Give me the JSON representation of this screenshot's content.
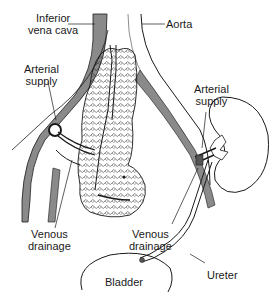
{
  "labels": {
    "ivc": [
      "Inferior",
      "vena cava"
    ],
    "aorta": "Aorta",
    "arterial_left": [
      "Arterial",
      "supply"
    ],
    "arterial_right": [
      "Arterial",
      "supply"
    ],
    "venous_left": [
      "Venous",
      "drainage"
    ],
    "venous_right": [
      "Venous",
      "drainage"
    ],
    "ureter": "Ureter",
    "bladder": "Bladder"
  },
  "colors": {
    "ink": "#1a1a1a",
    "vessel_fill": "#8a8a8a",
    "background": "#ffffff"
  }
}
